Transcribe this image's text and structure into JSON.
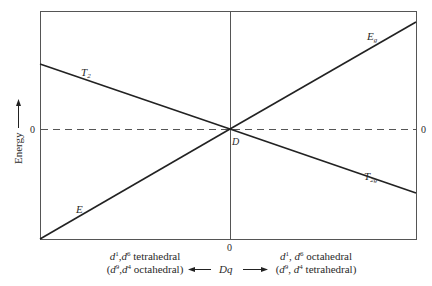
{
  "diagram": {
    "title": "",
    "y_axis_label": "Energy",
    "zero_labels": {
      "left": "0",
      "right": "0",
      "bottom": "0"
    },
    "center_point_label": "D",
    "x_axis_label": "Dq",
    "lines": [
      {
        "name": "T2",
        "label_main": "T",
        "label_sub": "2",
        "from": "left-upper",
        "to": "D"
      },
      {
        "name": "E",
        "label_main": "E",
        "label_sub": "",
        "from": "left-bottom",
        "to": "D"
      },
      {
        "name": "Eg",
        "label_main": "E",
        "label_sub": "g",
        "from": "D",
        "to": "right-top"
      },
      {
        "name": "T2g",
        "label_main": "T",
        "label_sub": "2g",
        "from": "D",
        "to": "right-lower"
      }
    ],
    "left_caption": {
      "line1_d1": "d",
      "line1_sup1": "1",
      "line1_sep": ",",
      "line1_d2": "d",
      "line1_sup2": "6",
      "line1_text": " tetrahedral",
      "line2_open": "(",
      "line2_d1": "d",
      "line2_sup1": "9",
      "line2_sep": ",",
      "line2_d2": "d",
      "line2_sup2": "4",
      "line2_text": " octahedral)"
    },
    "right_caption": {
      "line1_d1": "d",
      "line1_sup1": "1",
      "line1_sep": ", ",
      "line1_d2": "d",
      "line1_sup2": "6",
      "line1_text": " octahedral",
      "line2_open": "(",
      "line2_d1": "d",
      "line2_sup1": "9",
      "line2_sep": ", ",
      "line2_d2": "d",
      "line2_sup2": "4",
      "line2_text": " tetrahedral)"
    },
    "colors": {
      "ink": "#2a2a2a",
      "frame": "#555555",
      "dash": "#555555"
    }
  }
}
